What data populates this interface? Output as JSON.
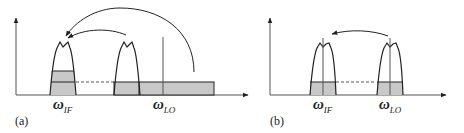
{
  "panels": [
    {
      "id": "a",
      "label": "(a)",
      "omega_if": {
        "symbol": "ω",
        "sub": "IF"
      },
      "omega_lo": {
        "symbol": "ω",
        "sub": "LO"
      }
    },
    {
      "id": "b",
      "label": "(b)",
      "omega_if": {
        "symbol": "ω",
        "sub": "IF"
      },
      "omega_lo": {
        "symbol": "ω",
        "sub": "LO"
      }
    }
  ],
  "colors": {
    "stroke": "#222222",
    "fill": "#c8c8c8",
    "axis": "#555555"
  }
}
